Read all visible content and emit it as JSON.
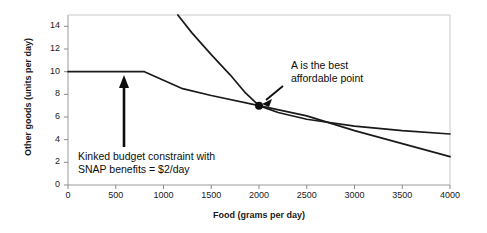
{
  "chart_data": {
    "type": "line",
    "title": "",
    "xlabel": "Food (grams per day)",
    "ylabel": "Other goods (units per day)",
    "xlim": [
      0,
      4000
    ],
    "ylim": [
      0,
      15
    ],
    "xticks": [
      0,
      500,
      1000,
      1500,
      2000,
      2500,
      3000,
      3500,
      4000
    ],
    "xtick_labels": [
      "0",
      "500",
      "1000",
      "1500",
      "2000",
      "2500",
      "3000",
      "3500",
      "4000"
    ],
    "yticks": [
      0,
      2,
      4,
      6,
      8,
      10,
      12,
      14
    ],
    "ytick_labels": [
      "0",
      "2",
      "4",
      "6",
      "8",
      "10",
      "12",
      "14"
    ],
    "grid": false,
    "legend": "none",
    "series": [
      {
        "name": "Kinked budget constraint",
        "type": "line",
        "color": "#1a1a1a",
        "points": [
          [
            0,
            10.0
          ],
          [
            400,
            10.0
          ],
          [
            800,
            10.0
          ],
          [
            1000,
            9.25
          ],
          [
            1200,
            8.5
          ],
          [
            1500,
            7.9
          ],
          [
            2000,
            7.0
          ],
          [
            2500,
            6.1
          ],
          [
            3000,
            4.8
          ],
          [
            3500,
            3.65
          ],
          [
            4000,
            2.5
          ]
        ]
      },
      {
        "name": "Indifference curve",
        "type": "line",
        "color": "#1a1a1a",
        "points": [
          [
            1150,
            15.0
          ],
          [
            1300,
            13.4
          ],
          [
            1500,
            11.5
          ],
          [
            1700,
            9.7
          ],
          [
            1850,
            8.2
          ],
          [
            2000,
            7.0
          ],
          [
            2200,
            6.4
          ],
          [
            2500,
            5.8
          ],
          [
            3000,
            5.2
          ],
          [
            3500,
            4.8
          ],
          [
            4000,
            4.5
          ]
        ]
      }
    ],
    "points": [
      {
        "name": "A",
        "x": 2000,
        "y": 7.0,
        "marker": "filled-circle",
        "color": "#0d0d0d"
      }
    ],
    "annotations": [
      {
        "name": "best-affordable-point",
        "lines": [
          "A is the best",
          "affordable point"
        ],
        "arrow": "diagonal-down-left",
        "target": [
          2000,
          7.0
        ]
      },
      {
        "name": "kinked-budget-constraint",
        "lines": [
          "Kinked budget constraint with",
          "SNAP benefits = $2/day"
        ],
        "arrow": "vertical-up",
        "target": [
          800,
          10.0
        ]
      }
    ]
  },
  "colors": {
    "line": "#1a1a1a",
    "axis": "#808080",
    "text": "#1a1a1a",
    "background": "#ffffff"
  }
}
